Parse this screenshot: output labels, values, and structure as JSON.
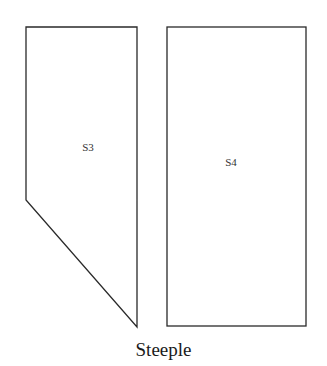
{
  "diagram": {
    "title": "Steeple",
    "stroke_color": "#2a2a2a",
    "background": "#ffffff",
    "pieces": [
      {
        "id": "S3",
        "label": "S3",
        "shape": "pentagon",
        "points": [
          [
            26,
            27
          ],
          [
            137,
            27
          ],
          [
            137,
            327
          ],
          [
            26,
            200
          ]
        ],
        "label_pos": [
          88,
          151
        ]
      },
      {
        "id": "S4",
        "label": "S4",
        "shape": "rectangle",
        "points": [
          [
            167,
            27
          ],
          [
            306,
            27
          ],
          [
            306,
            326
          ],
          [
            167,
            326
          ]
        ],
        "label_pos": [
          231,
          166
        ]
      }
    ]
  }
}
